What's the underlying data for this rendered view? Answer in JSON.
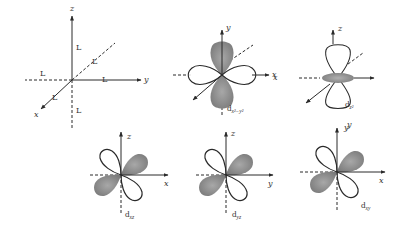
{
  "figure": {
    "colors": {
      "line": "#2a2a2a",
      "lobe_shaded": "#8a8a8a",
      "lobe_outline": "#2a2a2a",
      "background": "#ffffff"
    },
    "ligand_panel": {
      "axes": {
        "z": "z",
        "y": "y",
        "x": "x"
      },
      "ligand_label": "L",
      "ligand_labels": [
        "L",
        "L",
        "L",
        "L",
        "L",
        "L"
      ]
    },
    "orbitals": [
      {
        "id": "dx2-y2",
        "base": "d",
        "subscript": "x²−y²",
        "axes": {
          "vertical": "y",
          "horizontal": "x"
        }
      },
      {
        "id": "dz2",
        "base": "d",
        "subscript": "z²",
        "axes": {
          "vertical": "z",
          "left": "x",
          "bottom": "y"
        }
      },
      {
        "id": "dxz",
        "base": "d",
        "subscript": "xz",
        "axes": {
          "vertical": "z",
          "horizontal": "x"
        }
      },
      {
        "id": "dyz",
        "base": "d",
        "subscript": "yz",
        "axes": {
          "vertical": "z",
          "horizontal": "y"
        }
      },
      {
        "id": "dxy",
        "base": "d",
        "subscript": "xy",
        "axes": {
          "vertical": "y",
          "horizontal": "x"
        }
      }
    ]
  }
}
